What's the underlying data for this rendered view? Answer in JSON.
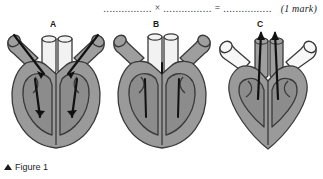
{
  "question": {
    "blank1": "................",
    "operator_multiply": "×",
    "blank2": "................",
    "operator_equals": "=",
    "blank3": "................",
    "marks": "(1 mark)"
  },
  "labels": {
    "a": "A",
    "b": "B",
    "c": "C"
  },
  "caption": {
    "marker": "triangle-up-icon",
    "text": "Figure 1"
  },
  "colors": {
    "muscle_fill": "#9a9a9a",
    "chamber_fill": "#8c8c8c",
    "outline": "#3a3a3a",
    "vessel_light": "#f2f2f2",
    "vessel_dark": "#9e9e9e",
    "arrow": "#111111",
    "background": "#ffffff",
    "text": "#222222"
  },
  "diagrams": [
    {
      "id": "heart-a",
      "label": "A",
      "state": "atrial-systole-filling",
      "arrows": "blood flowing from atria down into ventricles",
      "central_vessels": "light",
      "side_vessels": "dark",
      "apex": "rounded"
    },
    {
      "id": "heart-b",
      "label": "B",
      "state": "relaxed-diastole",
      "arrows": "none",
      "central_vessels": "light",
      "side_vessels": "dark",
      "apex": "rounded"
    },
    {
      "id": "heart-c",
      "label": "C",
      "state": "ventricular-systole-ejection",
      "arrows": "blood ejected upward through arteries",
      "central_vessels": "dark",
      "side_vessels": "light",
      "apex": "pointed"
    }
  ]
}
